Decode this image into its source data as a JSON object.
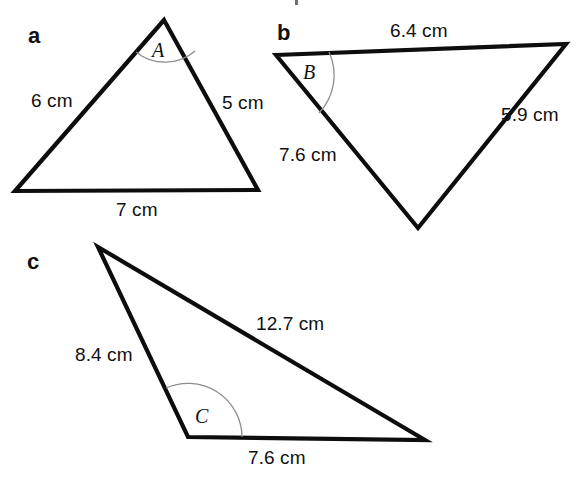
{
  "figure": {
    "title_fragment": "",
    "background_color": "#ffffff",
    "stroke_color": "#0d0d0d",
    "arc_color": "#8d8d8d",
    "text_color": "#111111",
    "width": 576,
    "height": 484
  },
  "items": [
    {
      "key": "a",
      "letter": "a",
      "angle_label": "A",
      "sides": [
        {
          "name": "left",
          "label": "6 cm"
        },
        {
          "name": "right",
          "label": "5 cm"
        },
        {
          "name": "base",
          "label": "7 cm"
        }
      ],
      "vertices": {
        "apex": [
          164,
          20
        ],
        "bottom_left": [
          15,
          191
        ],
        "bottom_right": [
          258,
          190
        ]
      }
    },
    {
      "key": "b",
      "letter": "b",
      "angle_label": "B",
      "sides": [
        {
          "name": "top",
          "label": "6.4 cm"
        },
        {
          "name": "right",
          "label": "5.9 cm"
        },
        {
          "name": "left",
          "label": "7.6 cm"
        }
      ],
      "vertices": {
        "top_left": [
          276,
          55
        ],
        "top_right": [
          566,
          44
        ],
        "bottom": [
          418,
          228
        ]
      }
    },
    {
      "key": "c",
      "letter": "c",
      "angle_label": "C",
      "sides": [
        {
          "name": "long",
          "label": "12.7 cm"
        },
        {
          "name": "left",
          "label": "8.4 cm"
        },
        {
          "name": "base",
          "label": "7.6 cm"
        }
      ],
      "vertices": {
        "top": [
          98,
          247
        ],
        "bottom_left": [
          188,
          437
        ],
        "bottom_right": [
          425,
          440
        ]
      }
    }
  ]
}
